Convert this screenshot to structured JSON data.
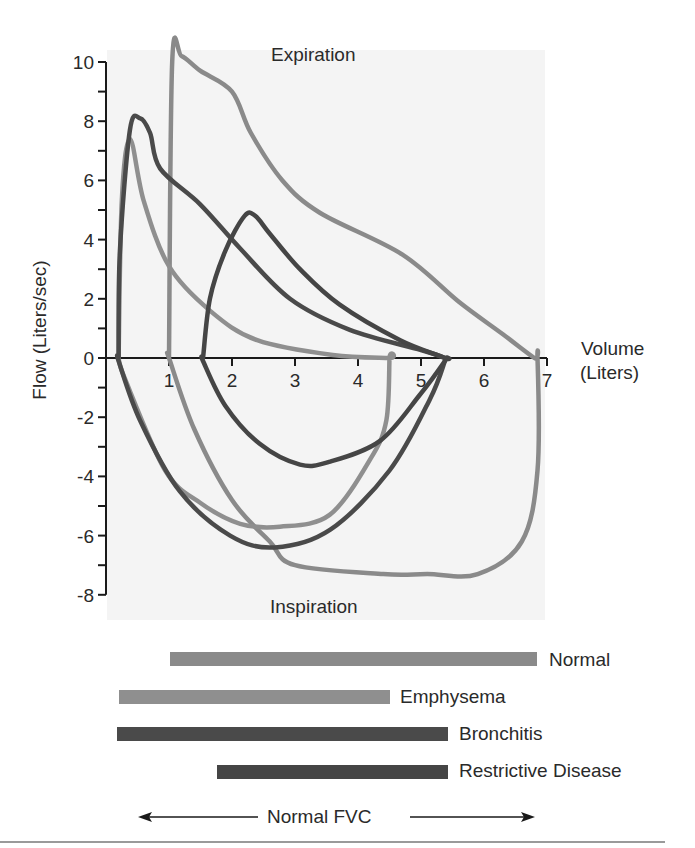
{
  "chart_data": {
    "type": "line",
    "title": "",
    "annotations": [
      "Expiration",
      "Inspiration"
    ],
    "xlabel": "Volume (Liters)",
    "ylabel": "Flow (Liters/sec)",
    "xlim": [
      0,
      7
    ],
    "ylim": [
      -8,
      10
    ],
    "x_ticks": [
      1,
      2,
      3,
      4,
      5,
      6,
      7
    ],
    "y_ticks": [
      10,
      8,
      6,
      4,
      2,
      0,
      -2,
      -4,
      -6,
      -8
    ],
    "y_minor_step": 1,
    "grid": false,
    "legend_position": "below",
    "series": [
      {
        "name": "Normal",
        "color": "#8a8a8a",
        "fvc_range": [
          1.0,
          6.8
        ],
        "peak_expiratory_flow": 10.2,
        "peak_inspiratory_flow": -7.3,
        "expiration": [
          [
            1.0,
            0
          ],
          [
            1.05,
            10.0
          ],
          [
            1.2,
            10.2
          ],
          [
            1.5,
            9.7
          ],
          [
            2.0,
            9.0
          ],
          [
            2.3,
            7.6
          ],
          [
            2.8,
            6.0
          ],
          [
            3.4,
            4.9
          ],
          [
            4.7,
            3.5
          ],
          [
            5.6,
            1.9
          ],
          [
            6.3,
            0.8
          ],
          [
            6.8,
            0
          ]
        ],
        "inspiration": [
          [
            6.85,
            0
          ],
          [
            6.85,
            -3.8
          ],
          [
            6.6,
            -6.2
          ],
          [
            5.9,
            -7.3
          ],
          [
            5.1,
            -7.3
          ],
          [
            4.4,
            -7.3
          ],
          [
            3.0,
            -7.0
          ],
          [
            2.6,
            -6.2
          ],
          [
            2.0,
            -4.8
          ],
          [
            1.4,
            -2.4
          ],
          [
            1.0,
            0
          ]
        ]
      },
      {
        "name": "Emphysema",
        "color": "#8f8f8f",
        "fvc_range": [
          0.2,
          4.5
        ],
        "peak_expiratory_flow": 7.4,
        "peak_inspiratory_flow": -5.6,
        "expiration": [
          [
            0.2,
            0
          ],
          [
            0.25,
            5.3
          ],
          [
            0.38,
            7.4
          ],
          [
            0.6,
            5.3
          ],
          [
            1.0,
            3.1
          ],
          [
            1.65,
            1.6
          ],
          [
            2.4,
            0.6
          ],
          [
            3.6,
            0.1
          ],
          [
            4.5,
            0
          ]
        ],
        "inspiration": [
          [
            4.5,
            0
          ],
          [
            4.45,
            -2.1
          ],
          [
            4.2,
            -3.4
          ],
          [
            3.55,
            -5.3
          ],
          [
            2.76,
            -5.7
          ],
          [
            2.13,
            -5.6
          ],
          [
            1.5,
            -4.9
          ],
          [
            0.94,
            -3.8
          ],
          [
            0.3,
            -0.7
          ]
        ]
      },
      {
        "name": "Bronchitis",
        "color": "#4a4a4a",
        "fvc_range": [
          0.2,
          5.4
        ],
        "peak_expiratory_flow": 8.1,
        "peak_inspiratory_flow": -6.2,
        "expiration": [
          [
            0.2,
            0
          ],
          [
            0.22,
            3.6
          ],
          [
            0.38,
            7.7
          ],
          [
            0.54,
            8.1
          ],
          [
            0.7,
            7.6
          ],
          [
            0.86,
            6.4
          ],
          [
            1.49,
            5.2
          ],
          [
            2.13,
            3.7
          ],
          [
            2.92,
            2.0
          ],
          [
            3.87,
            0.95
          ],
          [
            5.0,
            0.27
          ],
          [
            5.38,
            0
          ]
        ],
        "inspiration": [
          [
            5.38,
            -0.1
          ],
          [
            5.14,
            -1.4
          ],
          [
            4.5,
            -3.8
          ],
          [
            3.56,
            -5.8
          ],
          [
            2.68,
            -6.4
          ],
          [
            1.97,
            -6.0
          ],
          [
            1.17,
            -4.5
          ],
          [
            0.54,
            -2.1
          ],
          [
            0.2,
            -0.1
          ]
        ]
      },
      {
        "name": "Restrictive Disease",
        "color": "#454545",
        "fvc_range": [
          1.5,
          5.4
        ],
        "peak_expiratory_flow": 4.9,
        "peak_inspiratory_flow": -3.5,
        "expiration": [
          [
            1.54,
            0
          ],
          [
            1.65,
            2.0
          ],
          [
            1.89,
            3.6
          ],
          [
            2.2,
            4.8
          ],
          [
            2.37,
            4.8
          ],
          [
            2.6,
            4.2
          ],
          [
            3.08,
            3.0
          ],
          [
            3.71,
            1.8
          ],
          [
            4.67,
            0.6
          ],
          [
            5.38,
            0
          ]
        ],
        "inspiration": [
          [
            5.38,
            -0.1
          ],
          [
            4.98,
            -1.25
          ],
          [
            4.35,
            -2.8
          ],
          [
            3.56,
            -3.5
          ],
          [
            3.08,
            -3.6
          ],
          [
            2.44,
            -2.9
          ],
          [
            1.89,
            -1.6
          ],
          [
            1.54,
            -0.1
          ]
        ]
      }
    ],
    "fvc_bars": [
      {
        "name": "Normal",
        "start": 1.0,
        "end": 6.8
      },
      {
        "name": "Emphysema",
        "start": 0.2,
        "end": 4.5
      },
      {
        "name": "Bronchitis",
        "start": 0.2,
        "end": 5.4
      },
      {
        "name": "Restrictive Disease",
        "start": 1.5,
        "end": 5.4
      }
    ],
    "footer_annotation": "Normal FVC"
  },
  "labels": {
    "expiration": "Expiration",
    "inspiration": "Inspiration",
    "x_axis_line1": "Volume",
    "x_axis_line2": "(Liters)",
    "y_axis": "Flow (Liters/sec)",
    "normal_fvc": "Normal FVC"
  },
  "legend": [
    {
      "label": "Normal",
      "color": "#8a8a8a"
    },
    {
      "label": "Emphysema",
      "color": "#8f8f8f"
    },
    {
      "label": "Bronchitis",
      "color": "#4a4a4a"
    },
    {
      "label": "Restrictive Disease",
      "color": "#454545"
    }
  ]
}
